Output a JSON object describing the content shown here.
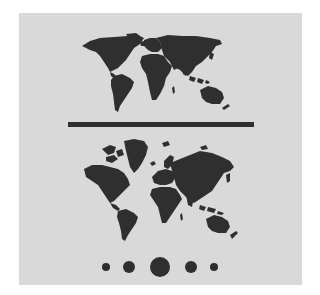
{
  "figure": {
    "background_color": "#d9d9d9",
    "ink_color": "#2f2f2f",
    "top_map": {
      "projection": "equal-area",
      "label": "world-map-equal-area"
    },
    "bottom_map": {
      "projection": "mercator",
      "label": "world-map-mercator"
    },
    "divider": {
      "label": "separator-bar"
    },
    "pagination_dots": [
      {
        "size": "small",
        "active": false
      },
      {
        "size": "medium",
        "active": false
      },
      {
        "size": "large",
        "active": true
      },
      {
        "size": "medium",
        "active": false
      },
      {
        "size": "small",
        "active": false
      }
    ]
  }
}
